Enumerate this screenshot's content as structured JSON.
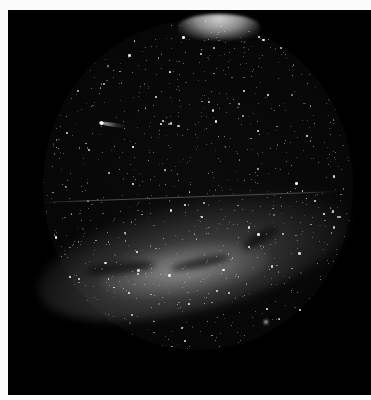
{
  "photo": {
    "subject": "All-sky fisheye night photograph",
    "frame": {
      "left": 8,
      "top": 10,
      "width": 363,
      "height": 385,
      "background": "#000000"
    },
    "border_color": "#fbfbfb",
    "sky_disc": {
      "cx": 198,
      "cy": 185,
      "rx": 155,
      "ry": 165,
      "color": "#0b0b0b"
    },
    "zenith_glow": {
      "left": 178,
      "top": 14,
      "width": 82,
      "height": 26,
      "color": "#cfcfcf"
    },
    "milky_way": {
      "left": 34,
      "top": 200,
      "width": 320,
      "height": 110,
      "rotate": -14,
      "color": "#9a9a9a",
      "core": {
        "left": 100,
        "top": 245,
        "width": 170,
        "height": 50,
        "color": "#b8b8b8"
      }
    },
    "dust_lanes": [
      {
        "left": 85,
        "top": 262,
        "width": 70,
        "height": 12,
        "rotate": -6
      },
      {
        "left": 170,
        "top": 258,
        "width": 60,
        "height": 10,
        "rotate": -12
      },
      {
        "left": 240,
        "top": 232,
        "width": 40,
        "height": 12,
        "rotate": -30
      }
    ],
    "comet": {
      "head_x": 101,
      "head_y": 123,
      "tail_length": 26,
      "tail_angle": 8,
      "color": "#eeeeee"
    },
    "satellite_trail": {
      "x1": 40,
      "y1": 202,
      "x2": 340,
      "y2": 191,
      "color": "#4a4a4a"
    },
    "nebula": {
      "x": 266,
      "y": 322,
      "size": 8,
      "color": "#9c9c9c"
    },
    "stars": {
      "count": 900,
      "seed": 42,
      "bright_fraction": 0.08
    }
  }
}
